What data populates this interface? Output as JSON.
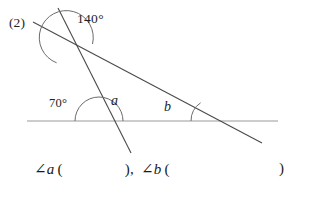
{
  "problem": {
    "number_label": "(2)"
  },
  "figure": {
    "angle_labels": {
      "top_angle": "140°",
      "left_base_angle": "70°",
      "angle_a": "a",
      "angle_b": "b"
    },
    "colors": {
      "line_stroke": "#4a4a4a",
      "horizontal_stroke": "#9a9a9a",
      "arc_stroke": "#6b6b6b",
      "text": "#232323",
      "background": "#ffffff"
    },
    "geometry": {
      "horizontal_line": {
        "x1": 27,
        "y1": 121,
        "x2": 278,
        "y2": 121
      },
      "steep_line": {
        "x1": 58,
        "y1": 8,
        "x2": 131,
        "y2": 153
      },
      "shallow_line": {
        "x1": 33,
        "y1": 22,
        "x2": 262,
        "y2": 143
      },
      "vertex_top": {
        "x": 68,
        "y": 38
      },
      "vertex_left_base": {
        "x": 99,
        "y": 121
      },
      "vertex_right_base": {
        "x": 213,
        "y": 121
      }
    }
  },
  "answer_line": {
    "angle_symbol": "∠",
    "variable_a": "a",
    "variable_b": "b",
    "paren_open": "(",
    "paren_close": ")",
    "separator": ","
  }
}
